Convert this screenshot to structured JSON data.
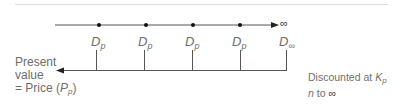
{
  "diagram": {
    "timeline": {
      "end_symbol": "∞",
      "payments": [
        {
          "symbol": "D",
          "subscript": "p"
        },
        {
          "symbol": "D",
          "subscript": "p"
        },
        {
          "symbol": "D",
          "subscript": "p"
        },
        {
          "symbol": "D",
          "subscript": "p"
        },
        {
          "symbol": "D",
          "subscript": "∞"
        }
      ]
    },
    "present_value_label": {
      "line1": "Present",
      "line2": "value",
      "line3_prefix": "= Price (",
      "line3_var": "P",
      "line3_sub": "p",
      "line3_suffix": ")"
    },
    "discount_note": {
      "line1_prefix": "Discounted at ",
      "line1_var": "K",
      "line1_sub": "p",
      "line2_var": "n",
      "line2_mid": " to ",
      "line2_end": "∞"
    },
    "colors": {
      "line": "#555555",
      "dot": "#111111",
      "text": "#6e6e6e",
      "divider": "#dddddd"
    }
  }
}
